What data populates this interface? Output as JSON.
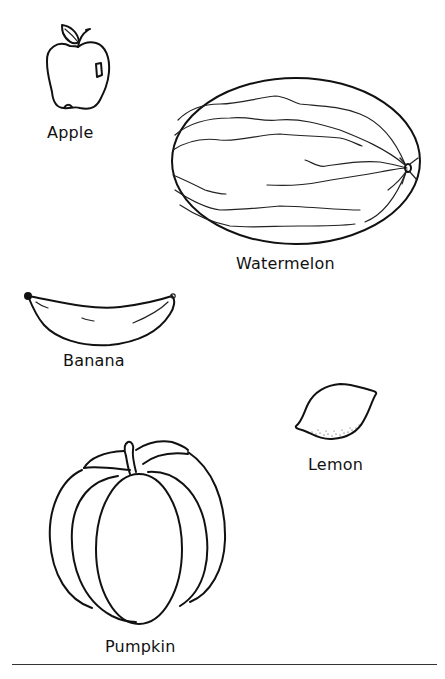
{
  "page": {
    "background": "#ffffff",
    "line_color": "#111111"
  },
  "items": [
    {
      "id": "apple",
      "label": "Apple",
      "icon": "apple-icon"
    },
    {
      "id": "watermelon",
      "label": "Watermelon",
      "icon": "watermelon-icon"
    },
    {
      "id": "banana",
      "label": "Banana",
      "icon": "banana-icon"
    },
    {
      "id": "lemon",
      "label": "Lemon",
      "icon": "lemon-icon"
    },
    {
      "id": "pumpkin",
      "label": "Pumpkin",
      "icon": "pumpkin-icon"
    }
  ]
}
